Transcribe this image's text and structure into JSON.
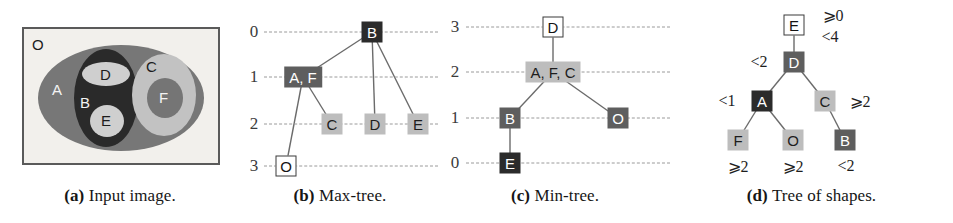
{
  "figure": {
    "panels": [
      {
        "id": "a",
        "caption_tag": "(a)",
        "caption_text": "Input image.",
        "region_labels": [
          "O",
          "A",
          "B",
          "C",
          "D",
          "E",
          "F"
        ],
        "labels": {
          "O": "O",
          "A": "A",
          "B": "B",
          "C": "C",
          "D": "D",
          "E": "E",
          "F": "F"
        },
        "colors": {
          "background": "#f2f0ec",
          "frame": "#5a5a5a",
          "A": "#777777",
          "B": "#2a2a2a",
          "C": "#c2c2c2",
          "D": "#cfcfcf",
          "E": "#cfcfcf",
          "F": "#757575"
        }
      },
      {
        "id": "b",
        "caption_tag": "(b)",
        "caption_text": "Max-tree.",
        "axis_ticks": [
          "0",
          "1",
          "2",
          "3"
        ],
        "nodes": [
          {
            "id": "B",
            "label": "B",
            "level": "0",
            "style": "dark"
          },
          {
            "id": "AF",
            "label": "A, F",
            "level": "1",
            "style": "mid"
          },
          {
            "id": "C",
            "label": "C",
            "level": "2",
            "style": "light"
          },
          {
            "id": "D",
            "label": "D",
            "level": "2",
            "style": "light"
          },
          {
            "id": "E",
            "label": "E",
            "level": "2",
            "style": "light"
          },
          {
            "id": "O",
            "label": "O",
            "level": "3",
            "style": "white"
          }
        ],
        "edges": [
          [
            "B",
            "AF"
          ],
          [
            "B",
            "D"
          ],
          [
            "B",
            "E"
          ],
          [
            "AF",
            "C"
          ],
          [
            "AF",
            "O"
          ]
        ]
      },
      {
        "id": "c",
        "caption_tag": "(c)",
        "caption_text": "Min-tree.",
        "axis_ticks": [
          "3",
          "2",
          "1",
          "0"
        ],
        "nodes": [
          {
            "id": "D",
            "label": "D",
            "level": "3",
            "style": "white"
          },
          {
            "id": "AFC",
            "label": "A, F, C",
            "level": "2",
            "style": "light"
          },
          {
            "id": "B",
            "label": "B",
            "level": "1",
            "style": "mid"
          },
          {
            "id": "O",
            "label": "O",
            "level": "1",
            "style": "mid"
          },
          {
            "id": "E",
            "label": "E",
            "level": "0",
            "style": "dark"
          }
        ],
        "edges": [
          [
            "D",
            "AFC"
          ],
          [
            "AFC",
            "B"
          ],
          [
            "AFC",
            "O"
          ],
          [
            "B",
            "E"
          ]
        ]
      },
      {
        "id": "d",
        "caption_tag": "(d)",
        "caption_text": "Tree of shapes.",
        "nodes": [
          {
            "id": "E",
            "label": "E",
            "style": "white"
          },
          {
            "id": "D",
            "label": "D",
            "style": "mid"
          },
          {
            "id": "A",
            "label": "A",
            "style": "dark"
          },
          {
            "id": "C",
            "label": "C",
            "style": "light"
          },
          {
            "id": "F",
            "label": "F",
            "style": "light"
          },
          {
            "id": "O",
            "label": "O",
            "style": "light"
          },
          {
            "id": "B",
            "label": "B",
            "style": "mid"
          }
        ],
        "annotations": [
          {
            "id": "E-upper",
            "text": "⩾0"
          },
          {
            "id": "E-lower",
            "text": "<4"
          },
          {
            "id": "D-side",
            "text": "<2"
          },
          {
            "id": "A-side",
            "text": "<1"
          },
          {
            "id": "C-side",
            "text": "⩾2"
          },
          {
            "id": "F-below",
            "text": "⩾2"
          },
          {
            "id": "O-below",
            "text": "⩾2"
          },
          {
            "id": "B-below",
            "text": "<2"
          }
        ],
        "edges": [
          [
            "E",
            "D"
          ],
          [
            "D",
            "A"
          ],
          [
            "D",
            "C"
          ],
          [
            "A",
            "F"
          ],
          [
            "A",
            "O"
          ],
          [
            "C",
            "B"
          ]
        ]
      }
    ]
  }
}
